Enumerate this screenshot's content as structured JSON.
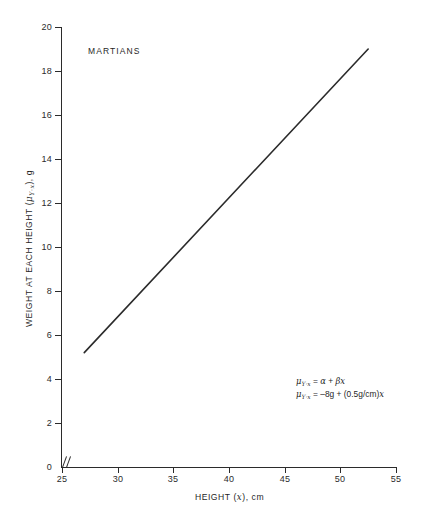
{
  "chart_data": {
    "type": "line",
    "title": "",
    "annotation_label": "MARTIANS",
    "xlabel": "HEIGHT (x), cm",
    "ylabel": "WEIGHT AT EACH HEIGHT (μY·x), g",
    "ylabel_parts": {
      "prefix": "WEIGHT AT EACH HEIGHT (",
      "mu": "μ",
      "subscript": "Y·x",
      "suffix": "), g"
    },
    "xlabel_parts": {
      "prefix": "HEIGHT (",
      "var": "x",
      "suffix": "), cm"
    },
    "xlim": [
      25,
      55
    ],
    "ylim": [
      0,
      20
    ],
    "xticks": [
      25,
      30,
      35,
      40,
      45,
      50,
      55
    ],
    "yticks": [
      0,
      2,
      4,
      6,
      8,
      10,
      12,
      14,
      16,
      18,
      20
    ],
    "grid": false,
    "legend": null,
    "axis_break": "//",
    "axis_break_note": "x-axis broken between 0 and 25",
    "series": [
      {
        "name": "Mean weight regression line",
        "x": [
          27,
          52.5
        ],
        "values": [
          5.2,
          19.0
        ],
        "line_color": "#2b2b2b",
        "line_width": 1.6
      }
    ],
    "equation_model": {
      "intercept": -8,
      "intercept_units": "g",
      "slope": 0.5,
      "slope_units": "g/cm"
    },
    "equations": [
      {
        "mu": "μ",
        "subscript": "Y·x",
        "rhs": "= α + βx",
        "rhs_plain": "α + βx"
      },
      {
        "mu": "μ",
        "subscript": "Y·x",
        "rhs": "= –8g + (0.5g/cm)x",
        "rhs_plain": "–8g + (0.5g/cm)x"
      }
    ],
    "colors": {
      "line": "#2b2b2b",
      "axis": "#2b2b2b",
      "text": "#1f1f1f",
      "background": "#ffffff"
    }
  },
  "labels": {
    "equation_1_mu": "μ",
    "equation_1_sub": "Y·x",
    "equation_1_eq": "=",
    "equation_1_alpha": "α",
    "equation_1_plus": "+",
    "equation_1_beta": "β",
    "equation_1_x": "x",
    "equation_2_mu": "μ",
    "equation_2_sub": "Y·x",
    "equation_2_eq": "=",
    "equation_2_b": "–8g",
    "equation_2_plus": "+",
    "equation_2_slope": "(0.5g/cm)",
    "equation_2_x": "x"
  }
}
